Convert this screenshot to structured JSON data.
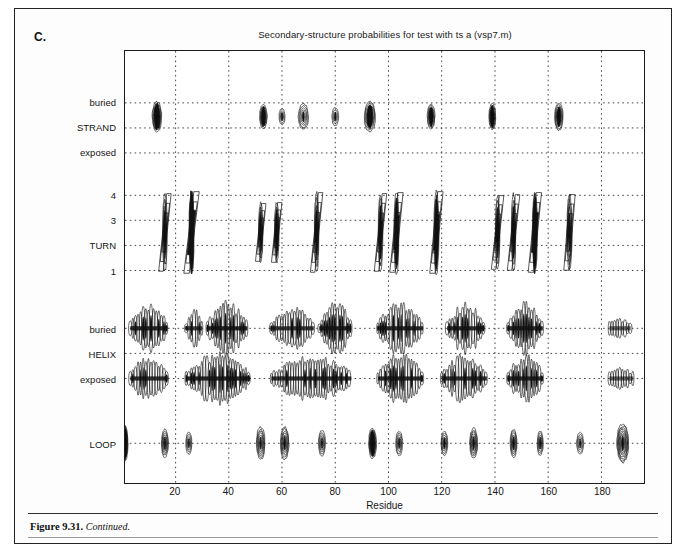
{
  "panel": {
    "letter": "C."
  },
  "caption": {
    "number": "Figure 9.31.",
    "text": "Continued."
  },
  "chart_data": {
    "type": "contour",
    "title": "Secondary-structure probabilities for test with ts a (vsp7.m)",
    "xlabel": "Residue",
    "ylabel": "",
    "xlim": [
      1,
      196
    ],
    "xticks": [
      20,
      40,
      60,
      80,
      100,
      120,
      140,
      160,
      180
    ],
    "xticklabels": [
      "20",
      "40",
      "60",
      "80",
      "100",
      "120",
      "140",
      "160",
      "180"
    ],
    "grid": "dotted",
    "legend": "none",
    "ylabels": [
      {
        "label": "buried",
        "y": 0.88
      },
      {
        "label": "STRAND",
        "y": 0.822
      },
      {
        "label": "exposed",
        "y": 0.764
      },
      {
        "label": "4",
        "y": 0.666
      },
      {
        "label": "3",
        "y": 0.608
      },
      {
        "label": "TURN",
        "y": 0.55
      },
      {
        "label": "1",
        "y": 0.492
      },
      {
        "label": "buried",
        "y": 0.358
      },
      {
        "label": "HELIX",
        "y": 0.3
      },
      {
        "label": "exposed",
        "y": 0.242
      },
      {
        "label": "LOOP",
        "y": 0.092
      }
    ],
    "bands": [
      {
        "name": "STRAND",
        "rows": [
          0.88,
          0.822,
          0.764
        ]
      },
      {
        "name": "TURN",
        "rows": [
          0.666,
          0.608,
          0.55,
          0.492
        ]
      },
      {
        "name": "HELIX",
        "rows": [
          0.358,
          0.3,
          0.242
        ]
      },
      {
        "name": "LOOP",
        "rows": [
          0.092
        ]
      }
    ],
    "series": [
      {
        "name": "STRAND",
        "row_y": 0.848,
        "peaks": [
          {
            "x": 13,
            "w": 11,
            "h": 30,
            "rings": 9,
            "solid": 0.62
          },
          {
            "x": 53,
            "w": 9,
            "h": 24,
            "rings": 7,
            "solid": 0.55
          },
          {
            "x": 60,
            "w": 7,
            "h": 16,
            "rings": 4,
            "solid": 0.22
          },
          {
            "x": 68,
            "w": 12,
            "h": 26,
            "rings": 6,
            "solid": 0.14
          },
          {
            "x": 80,
            "w": 8,
            "h": 18,
            "rings": 4,
            "solid": 0.22
          },
          {
            "x": 93,
            "w": 13,
            "h": 30,
            "rings": 8,
            "solid": 0.52
          },
          {
            "x": 116,
            "w": 9,
            "h": 25,
            "rings": 7,
            "solid": 0.52
          },
          {
            "x": 139,
            "w": 8,
            "h": 26,
            "rings": 7,
            "solid": 0.58
          },
          {
            "x": 164,
            "w": 10,
            "h": 27,
            "rings": 8,
            "solid": 0.45
          }
        ]
      },
      {
        "name": "TURN",
        "row_y": 0.58,
        "peaks": [
          {
            "x": 16,
            "slant": 4,
            "h": 78,
            "w": 5,
            "solid": 0.3
          },
          {
            "x": 26,
            "slant": 5,
            "h": 82,
            "w": 6,
            "solid": 0.78
          },
          {
            "x": 52,
            "slant": 3,
            "h": 58,
            "w": 5,
            "solid": 0.35
          },
          {
            "x": 58,
            "slant": 3,
            "h": 60,
            "w": 5,
            "solid": 0.5
          },
          {
            "x": 73,
            "slant": 4,
            "h": 80,
            "w": 5,
            "solid": 0.3
          },
          {
            "x": 97,
            "slant": 4,
            "h": 78,
            "w": 5,
            "solid": 0.4
          },
          {
            "x": 103,
            "slant": 4,
            "h": 80,
            "w": 6,
            "solid": 0.6
          },
          {
            "x": 118,
            "slant": 4,
            "h": 82,
            "w": 6,
            "solid": 0.62
          },
          {
            "x": 141,
            "slant": 4,
            "h": 74,
            "w": 5,
            "solid": 0.35
          },
          {
            "x": 147,
            "slant": 4,
            "h": 76,
            "w": 5,
            "solid": 0.4
          },
          {
            "x": 155,
            "slant": 4,
            "h": 80,
            "w": 6,
            "solid": 0.7
          },
          {
            "x": 168,
            "slant": 3,
            "h": 76,
            "w": 6,
            "solid": 0.2
          }
        ]
      },
      {
        "name": "HELIX-buried",
        "row_y": 0.358,
        "clusters": [
          {
            "x0": 3,
            "x1": 17,
            "density": 0.8
          },
          {
            "x0": 24,
            "x1": 30,
            "density": 0.55
          },
          {
            "x0": 32,
            "x1": 47,
            "density": 0.85
          },
          {
            "x0": 56,
            "x1": 72,
            "density": 0.6
          },
          {
            "x0": 74,
            "x1": 86,
            "density": 0.85
          },
          {
            "x0": 96,
            "x1": 113,
            "density": 0.8
          },
          {
            "x0": 122,
            "x1": 136,
            "density": 0.78
          },
          {
            "x0": 145,
            "x1": 158,
            "density": 0.8
          },
          {
            "x0": 183,
            "x1": 191,
            "density": 0.12
          }
        ]
      },
      {
        "name": "HELIX-exposed",
        "row_y": 0.242,
        "clusters": [
          {
            "x0": 3,
            "x1": 17,
            "density": 0.7
          },
          {
            "x0": 24,
            "x1": 48,
            "density": 0.82
          },
          {
            "x0": 56,
            "x1": 86,
            "density": 0.72
          },
          {
            "x0": 96,
            "x1": 113,
            "density": 0.78
          },
          {
            "x0": 120,
            "x1": 137,
            "density": 0.72
          },
          {
            "x0": 145,
            "x1": 158,
            "density": 0.76
          },
          {
            "x0": 183,
            "x1": 192,
            "density": 0.15
          }
        ]
      },
      {
        "name": "LOOP",
        "row_y": 0.092,
        "peaks": [
          {
            "x": 1,
            "w": 7,
            "h": 34,
            "rings": 9,
            "solid": 0.7
          },
          {
            "x": 16,
            "w": 8,
            "h": 28,
            "rings": 7,
            "solid": 0.18
          },
          {
            "x": 25,
            "w": 7,
            "h": 22,
            "rings": 5,
            "solid": 0.15
          },
          {
            "x": 52,
            "w": 10,
            "h": 32,
            "rings": 8,
            "solid": 0.12
          },
          {
            "x": 61,
            "w": 10,
            "h": 32,
            "rings": 8,
            "solid": 0.16
          },
          {
            "x": 75,
            "w": 8,
            "h": 26,
            "rings": 6,
            "solid": 0.14
          },
          {
            "x": 94,
            "w": 9,
            "h": 30,
            "rings": 9,
            "solid": 0.6
          },
          {
            "x": 104,
            "w": 8,
            "h": 24,
            "rings": 6,
            "solid": 0.16
          },
          {
            "x": 121,
            "w": 8,
            "h": 24,
            "rings": 6,
            "solid": 0.2
          },
          {
            "x": 132,
            "w": 9,
            "h": 30,
            "rings": 8,
            "solid": 0.16
          },
          {
            "x": 147,
            "w": 8,
            "h": 28,
            "rings": 7,
            "solid": 0.2
          },
          {
            "x": 157,
            "w": 7,
            "h": 24,
            "rings": 6,
            "solid": 0.22
          },
          {
            "x": 172,
            "w": 8,
            "h": 22,
            "rings": 5,
            "solid": 0.14
          },
          {
            "x": 188,
            "w": 14,
            "h": 38,
            "rings": 11,
            "solid": 0.14
          }
        ]
      }
    ],
    "colors": {
      "ink": "#111111",
      "grid": "#333333",
      "background": "#ffffff"
    }
  }
}
